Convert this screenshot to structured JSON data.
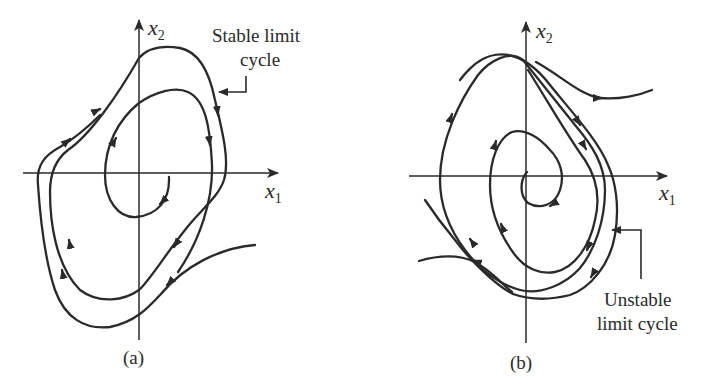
{
  "figure": {
    "panel_a": {
      "x_axis_label": "x",
      "x_axis_sub": "1",
      "y_axis_label": "x",
      "y_axis_sub": "2",
      "annotation_line1": "Stable limit",
      "annotation_line2": "cycle",
      "caption": "(a)"
    },
    "panel_b": {
      "x_axis_label": "x",
      "x_axis_sub": "1",
      "y_axis_label": "x",
      "y_axis_sub": "2",
      "annotation_line1": "Unstable",
      "annotation_line2": "limit cycle",
      "caption": "(b)"
    },
    "colors": {
      "ink": "#2a2a2a",
      "background": "#ffffff"
    }
  }
}
